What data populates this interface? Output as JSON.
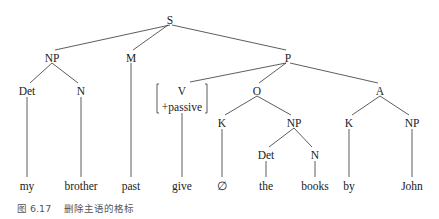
{
  "figure": {
    "caption_number": "图 6.17",
    "caption_text": "删除主语的格标"
  },
  "tree": {
    "nodes": [
      {
        "id": "S",
        "label": "S",
        "x": 170,
        "y": 22
      },
      {
        "id": "NP1",
        "label": "NP",
        "x": 52,
        "y": 60
      },
      {
        "id": "M",
        "label": "M",
        "x": 131,
        "y": 60
      },
      {
        "id": "P",
        "label": "P",
        "x": 288,
        "y": 60
      },
      {
        "id": "Det1",
        "label": "Det",
        "x": 27,
        "y": 93
      },
      {
        "id": "N1",
        "label": "N",
        "x": 81,
        "y": 93
      },
      {
        "id": "V",
        "label": "V",
        "x": 182,
        "y": 93
      },
      {
        "id": "Vfeat",
        "label": "+passive",
        "x": 182,
        "y": 109
      },
      {
        "id": "O",
        "label": "O",
        "x": 257,
        "y": 93
      },
      {
        "id": "A",
        "label": "A",
        "x": 380,
        "y": 93
      },
      {
        "id": "K1",
        "label": "K",
        "x": 222,
        "y": 125
      },
      {
        "id": "NP2",
        "label": "NP",
        "x": 294,
        "y": 125
      },
      {
        "id": "K2",
        "label": "K",
        "x": 349,
        "y": 125
      },
      {
        "id": "NP3",
        "label": "NP",
        "x": 412,
        "y": 125
      },
      {
        "id": "Det2",
        "label": "Det",
        "x": 266,
        "y": 157
      },
      {
        "id": "N2",
        "label": "N",
        "x": 315,
        "y": 157
      }
    ],
    "terminals": [
      {
        "label": "my",
        "x": 27
      },
      {
        "label": "brother",
        "x": 81
      },
      {
        "label": "past",
        "x": 131
      },
      {
        "label": "give",
        "x": 182
      },
      {
        "label": "∅",
        "x": 222
      },
      {
        "label": "the",
        "x": 266
      },
      {
        "label": "books",
        "x": 315
      },
      {
        "label": "by",
        "x": 349
      },
      {
        "label": "John",
        "x": 412
      }
    ],
    "terminal_y": 188
  }
}
